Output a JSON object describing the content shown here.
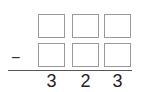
{
  "problem": {
    "operator": "−",
    "top_row": [
      "",
      "",
      ""
    ],
    "bottom_row": [
      "",
      "",
      ""
    ],
    "result_digits": [
      "3",
      "2",
      "3"
    ]
  }
}
